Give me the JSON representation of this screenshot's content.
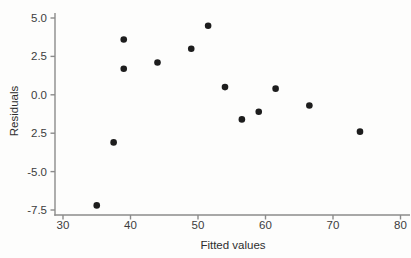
{
  "figure": {
    "kind": "scatter-plot"
  },
  "chart_data": {
    "type": "scatter",
    "title": "",
    "xlabel": "Fitted values",
    "ylabel": "Residuals",
    "xlim": [
      30,
      80
    ],
    "ylim": [
      -7.5,
      5.0
    ],
    "grid": false,
    "legend": "none",
    "marker": "filled-circle",
    "x_ticks": [
      30,
      40,
      50,
      60,
      70,
      80
    ],
    "x_tick_labels": [
      "30",
      "40",
      "50",
      "60",
      "70",
      "80"
    ],
    "y_ticks": [
      5.0,
      2.5,
      0.0,
      -2.5,
      -5.0,
      -7.5
    ],
    "y_tick_labels": [
      "5.0",
      "2.5",
      "0.0",
      "2.5",
      "-5.0",
      "-7.5"
    ],
    "points": [
      {
        "x": 35.0,
        "y": -7.2
      },
      {
        "x": 37.5,
        "y": -3.1
      },
      {
        "x": 39.0,
        "y": 3.6
      },
      {
        "x": 39.0,
        "y": 1.7
      },
      {
        "x": 44.0,
        "y": 2.1
      },
      {
        "x": 49.0,
        "y": 3.0
      },
      {
        "x": 51.5,
        "y": 4.5
      },
      {
        "x": 54.0,
        "y": 0.5
      },
      {
        "x": 56.5,
        "y": -1.6
      },
      {
        "x": 59.0,
        "y": -1.1
      },
      {
        "x": 61.5,
        "y": 0.4
      },
      {
        "x": 66.5,
        "y": -0.7
      },
      {
        "x": 74.0,
        "y": -2.4
      }
    ],
    "colors": {
      "point": "#1d1d1d",
      "axis": "#8b8b8b",
      "tick_text": "#3c3c3c",
      "background": "#fdfdfc"
    }
  }
}
